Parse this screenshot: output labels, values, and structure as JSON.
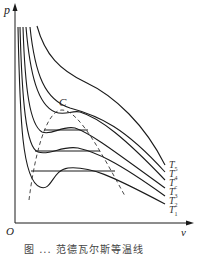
{
  "figure": {
    "axis": {
      "y_label": "p",
      "x_label": "v",
      "origin_label": "O"
    },
    "critical_point_label": "C",
    "isotherms": [
      {
        "label": "T",
        "sub": "5"
      },
      {
        "label": "T",
        "sub": "4"
      },
      {
        "label": "T",
        "sub": "c"
      },
      {
        "label": "T",
        "sub": "3"
      },
      {
        "label": "T",
        "sub": "2"
      },
      {
        "label": "T",
        "sub": "1"
      }
    ],
    "caption": "图 ...  范德瓦尔斯等温线"
  },
  "colors": {
    "line": "#1a1a1a",
    "dashed": "#333333",
    "background": "#ffffff"
  }
}
